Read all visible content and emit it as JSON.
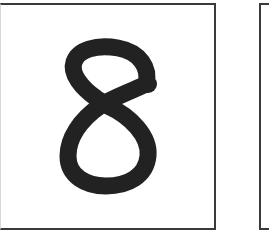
{
  "cards": [
    {
      "id": "card-1",
      "content_type": "handwritten-digit",
      "digit": "8",
      "stroke_color": "#222222",
      "border_color": "#3a3a3a"
    },
    {
      "id": "card-2",
      "content_type": "empty-partial-card",
      "border_color": "#3a3a3a"
    }
  ],
  "colors": {
    "background": "#ffffff",
    "ink": "#222222",
    "border": "#3a3a3a"
  }
}
